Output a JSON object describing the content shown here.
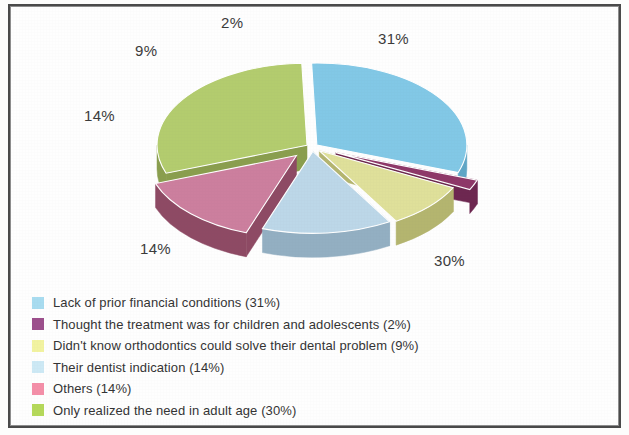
{
  "chart_data": {
    "type": "pie",
    "title": "",
    "subtitle": "",
    "three_d": true,
    "exploded": true,
    "legend_position": "bottom-left",
    "grid": false,
    "xlabel": "",
    "ylabel": "",
    "categories": [
      "Lack of prior financial conditions",
      "Thought the treatment was for children and adolescents",
      "Didn't know orthodontics could solve their dental problem",
      "Their dentist indication",
      "Others",
      "Only realized the need in adult age"
    ],
    "values": [
      31,
      2,
      9,
      14,
      14,
      30
    ],
    "value_labels": [
      "31%",
      "2%",
      "9%",
      "14%",
      "14%",
      "30%"
    ],
    "colors": [
      "#82c8e6",
      "#8e3868",
      "#dfe09a",
      "#bcd7e8",
      "#cc7f9e",
      "#b3cc6e"
    ],
    "side_colors": [
      "#5fa6c6",
      "#6d2750",
      "#b4b56f",
      "#93afc2",
      "#8e4a64",
      "#8a9e4e"
    ],
    "units": "%"
  },
  "labels": {
    "pct_31": "31%",
    "pct_2": "2%",
    "pct_9": "9%",
    "pct_14_left": "14%",
    "pct_14_bottom": "14%",
    "pct_30": "30%"
  },
  "legend": {
    "items": [
      {
        "swatch_name": "legend-swatch-blue",
        "color": "#a8dcf0",
        "label": "Lack of prior financial conditions (31%)"
      },
      {
        "swatch_name": "legend-swatch-purple",
        "color": "#9c4f8c",
        "label": "Thought the treatment was for children and adolescents (2%)"
      },
      {
        "swatch_name": "legend-swatch-yellow",
        "color": "#f2f3a0",
        "label": "Didn't know orthodontics could solve their dental problem (9%)"
      },
      {
        "swatch_name": "legend-swatch-pale-blue",
        "color": "#cde9f5",
        "label": "Their dentist indication (14%)"
      },
      {
        "swatch_name": "legend-swatch-pink",
        "color": "#f48fa8",
        "label": "Others (14%)"
      },
      {
        "swatch_name": "legend-swatch-green",
        "color": "#b5d95a",
        "label": "Only realized the need in adult age (30%)"
      }
    ]
  }
}
